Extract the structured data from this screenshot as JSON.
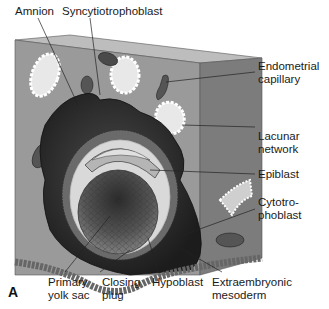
{
  "figure": {
    "panel_letter": "A"
  },
  "labels": {
    "amnion": "Amnion",
    "syncytiotrophoblast": "Syncytiotrophoblast",
    "endometrial_capillary": [
      "Endometrial",
      "capillary"
    ],
    "lacunar_network": [
      "Lacunar",
      "network"
    ],
    "epiblast": "Epiblast",
    "cytotrophoblast": [
      "Cytotro-",
      "phoblast"
    ],
    "primary_yolk_sac": [
      "Primary",
      "yolk sac"
    ],
    "closing_plug": [
      "Closing",
      "plug"
    ],
    "hypoblast": "Hypoblast",
    "extraembryonic_mesoderm": [
      "Extraembryonic",
      "mesoderm"
    ]
  },
  "colors": {
    "block_front": "#9a9a9a",
    "block_top": "#bdbdbd",
    "block_side": "#7c7c7c",
    "syncytio": "#2e2e2e",
    "cytotropho": "#6a6a6a",
    "cavity": "#d9d9d9",
    "yolk_sac": "#5a5a5a",
    "epithelium": "#8e8e8e",
    "leader_line": "#222222"
  }
}
